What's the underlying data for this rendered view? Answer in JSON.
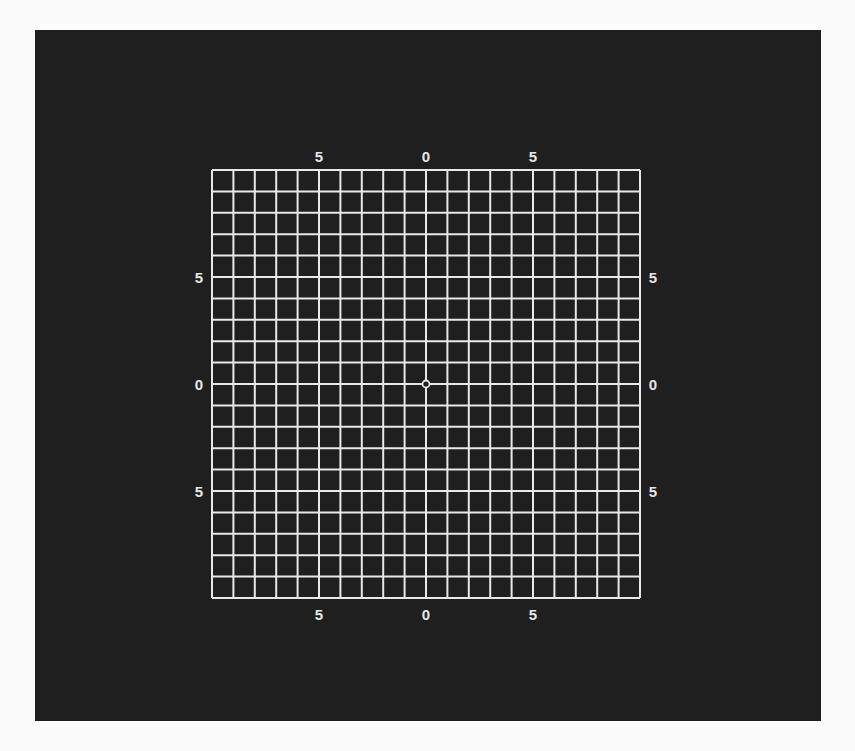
{
  "figure": {
    "type": "amsler-grid",
    "background_color": "#1f1f1f",
    "line_color": "#e8e8e8",
    "page_color": "#fbfbfb",
    "grid": {
      "left": 212,
      "top": 170,
      "size": 428,
      "cells": 20
    },
    "center_dot": {
      "x": 426,
      "y": 384,
      "r": 3.5
    }
  },
  "labels": {
    "top": [
      "5",
      "0",
      "5"
    ],
    "bottom": [
      "5",
      "0",
      "5"
    ],
    "left": [
      "5",
      "0",
      "5"
    ],
    "right": [
      "5",
      "0",
      "5"
    ]
  }
}
